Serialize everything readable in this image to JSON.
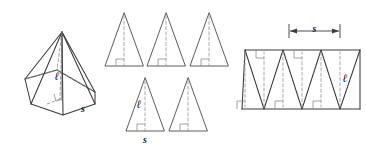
{
  "figure": {
    "background_color": "#ffffff",
    "line_color": "#4a4a4a",
    "dashed_line_color": "#9a9a9a",
    "label_color": "#1a1a1a"
  },
  "labels": {
    "slant_height": "ℓ",
    "base_edge": "s"
  },
  "panels": [
    {
      "id": "pyramid",
      "name": "hexagonal-pyramid",
      "caption": "",
      "labels": [
        {
          "text": "ℓ",
          "role": "slant-height"
        },
        {
          "text": "s",
          "role": "base-edge"
        }
      ],
      "features": [
        "apex",
        "hexagonal-base",
        "hidden-edges",
        "right-angle-mark"
      ]
    },
    {
      "id": "faces",
      "name": "separated-triangular-faces",
      "caption": "",
      "face_count": 6,
      "rows": [
        {
          "row": 1,
          "count": 3
        },
        {
          "row": 2,
          "count": 3
        }
      ],
      "labels": [
        {
          "text": "ℓ",
          "role": "slant-height"
        },
        {
          "text": "s",
          "role": "base-edge"
        }
      ],
      "features": [
        "dashed-altitude",
        "right-angle-mark"
      ]
    },
    {
      "id": "net",
      "name": "lateral-surface-net",
      "caption": "",
      "labels": [
        {
          "text": "s",
          "role": "base-edge-dimension"
        },
        {
          "text": "ℓ",
          "role": "slant-height"
        }
      ],
      "features": [
        "zigzag-band",
        "dimension-line",
        "dashed-altitudes",
        "right-angle-marks"
      ]
    }
  ]
}
